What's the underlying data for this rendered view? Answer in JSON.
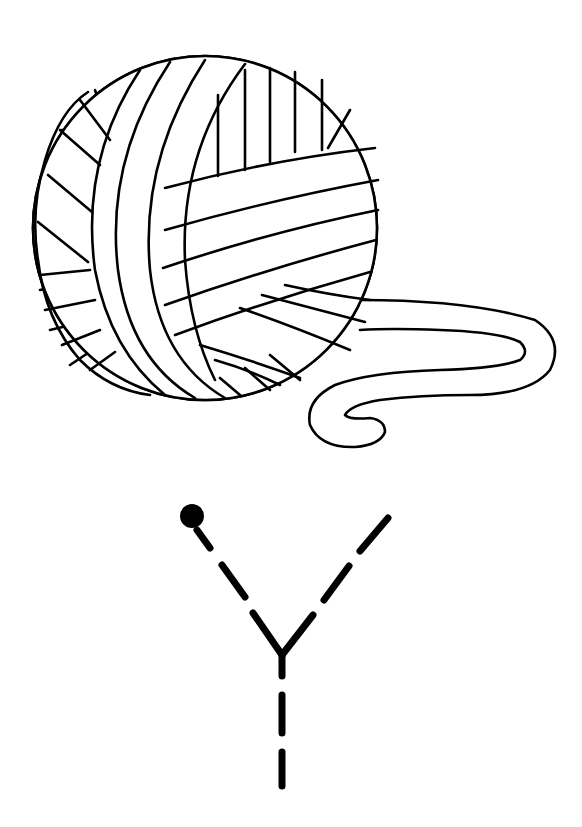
{
  "worksheet": {
    "type": "letter-tracing",
    "letter": "Y",
    "picture": "ball of yarn",
    "stroke_color": "#000000",
    "background": "#ffffff"
  }
}
